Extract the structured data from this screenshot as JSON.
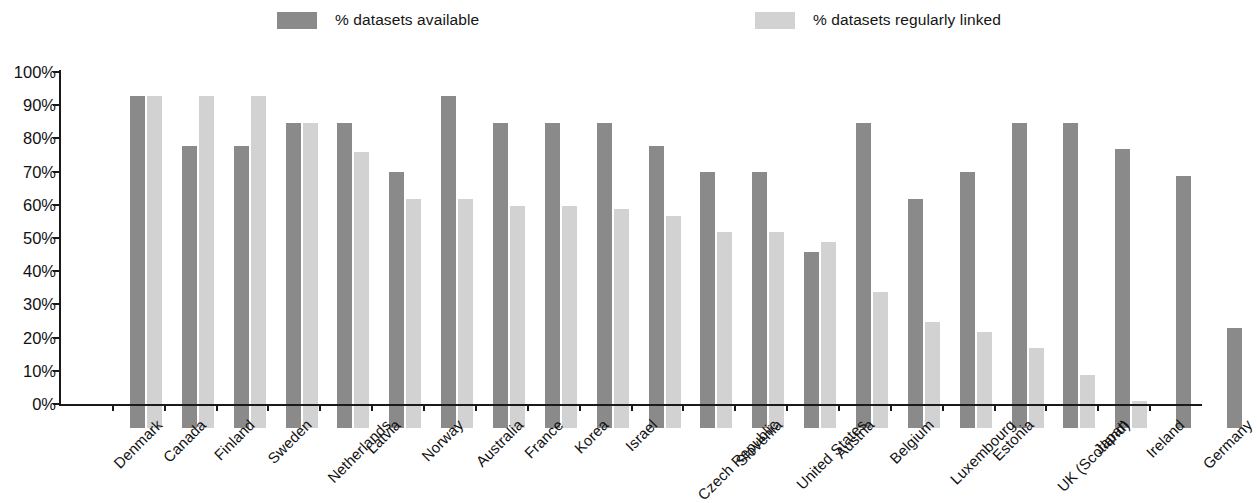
{
  "legend": {
    "items": [
      {
        "label": "% datasets available",
        "color": "#8a8a8a",
        "key": "available"
      },
      {
        "label": "% datasets regularly linked",
        "color": "#d2d2d2",
        "key": "linked"
      }
    ]
  },
  "axis": {
    "y_ticks": [
      "100%",
      "90%",
      "80%",
      "70%",
      "60%",
      "50%",
      "40%",
      "30%",
      "20%",
      "10%",
      "0%"
    ]
  },
  "chart_data": {
    "type": "bar",
    "title": "",
    "xlabel": "",
    "ylabel": "",
    "ylim": [
      0,
      100
    ],
    "grid": false,
    "legend_position": "top",
    "categories": [
      "Denmark",
      "Canada",
      "Finland",
      "Sweden",
      "Netherlands",
      "Latvia",
      "Norway",
      "Australia",
      "France",
      "Korea",
      "Israel",
      "Czech Republic",
      "Slovenia",
      "United States",
      "Austria",
      "Belgium",
      "Luxembourg",
      "Estonia",
      "UK (Scotland)",
      "Japan",
      "Ireland",
      "Germany"
    ],
    "series": [
      {
        "name": "% datasets available",
        "color": "#8a8a8a",
        "values": [
          100,
          85,
          85,
          92,
          92,
          77,
          100,
          92,
          92,
          92,
          85,
          77,
          77,
          53,
          92,
          69,
          77,
          92,
          92,
          84,
          76,
          30
        ]
      },
      {
        "name": "% datasets regularly linked",
        "color": "#d2d2d2",
        "values": [
          100,
          100,
          100,
          92,
          83,
          69,
          69,
          67,
          67,
          66,
          64,
          59,
          59,
          56,
          41,
          32,
          29,
          24,
          16,
          8,
          0,
          0
        ]
      }
    ],
    "tick_labels_y": [
      "0%",
      "10%",
      "20%",
      "30%",
      "40%",
      "50%",
      "60%",
      "70%",
      "80%",
      "90%",
      "100%"
    ]
  }
}
